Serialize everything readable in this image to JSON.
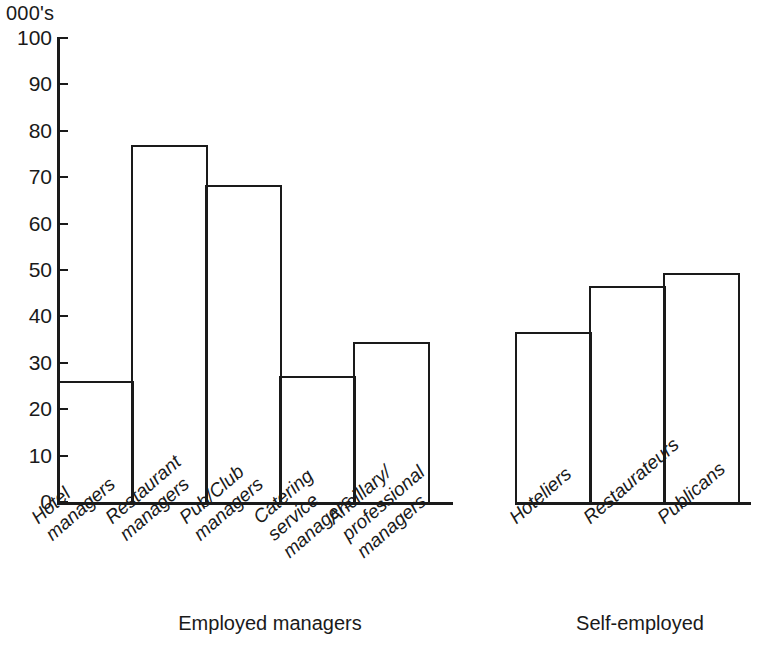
{
  "chart_data": {
    "type": "bar",
    "title": "",
    "subtitle": "",
    "xlabel": "",
    "ylabel": "000's",
    "ylim": [
      0,
      100
    ],
    "ytick_step": 10,
    "yticks": [
      100,
      90,
      80,
      70,
      60,
      50,
      40,
      30,
      20,
      10,
      0
    ],
    "grid": false,
    "legend": "none",
    "orientation": "vertical",
    "bar_style": "outline-only",
    "groups": [
      {
        "name": "Employed managers",
        "caption": "Employed managers",
        "categories": [
          "Hotel\nmanagers",
          "Restaurant\nmanagers",
          "Pub/Club\nmanagers",
          "Catering\nservice\nmanagers",
          "Ancillary/\nprofessional\nmanagers"
        ],
        "values": [
          26.5,
          77.3,
          68.8,
          27.5,
          35.0
        ]
      },
      {
        "name": "Self-employed",
        "caption": "Self-employed",
        "categories": [
          "Hoteliers",
          "Restaurateurs",
          "Publicans"
        ],
        "values": [
          37.0,
          47.0,
          49.7
        ]
      }
    ]
  },
  "axis": {
    "unit_label": "000's",
    "tick_labels": [
      "100",
      "90",
      "80",
      "70",
      "60",
      "50",
      "40",
      "30",
      "20",
      "10",
      "0"
    ]
  },
  "colors": {
    "ink": "#1a1a1a",
    "background": "#ffffff"
  }
}
